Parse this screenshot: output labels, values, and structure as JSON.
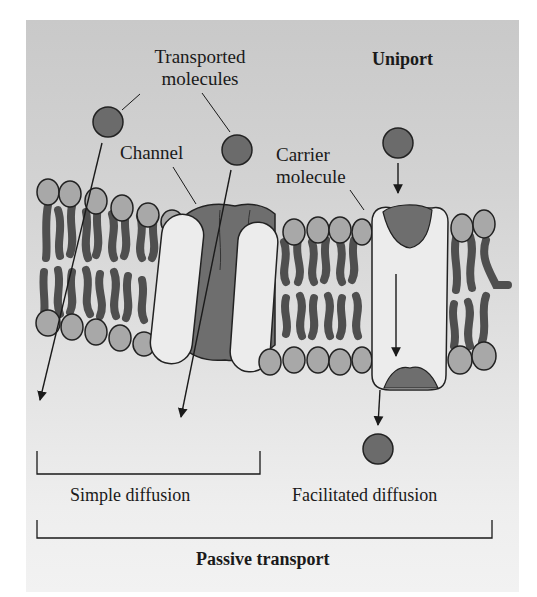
{
  "title": "Uniport",
  "labels": {
    "transported_molecules_line1": "Transported",
    "transported_molecules_line2": "molecules",
    "channel": "Channel",
    "carrier_line1": "Carrier",
    "carrier_line2": "molecule",
    "simple_diffusion": "Simple diffusion",
    "facilitated_diffusion": "Facilitated diffusion",
    "passive_transport": "Passive transport"
  },
  "colors": {
    "panel_top": "#c9c9c9",
    "panel_bottom": "#f2f2f2",
    "molecule": "#6b6b6b",
    "lipid_head": "#a8a8a8",
    "lipid_tail": "#4f4f4f",
    "protein_light": "#ececec",
    "protein_dark": "#6e6e6e",
    "line": "#1a1a1a"
  },
  "components": [
    {
      "name": "lipid-bilayer",
      "description": "Phospholipid bilayer membrane"
    },
    {
      "name": "channel-protein",
      "description": "Channel spanning the membrane"
    },
    {
      "name": "carrier-protein",
      "description": "Carrier molecule with binding sites"
    },
    {
      "name": "transported-molecules",
      "description": "Solute molecules crossing membrane"
    }
  ],
  "groups": [
    {
      "label": "Simple diffusion",
      "members": [
        "direct through bilayer",
        "through channel"
      ]
    },
    {
      "label": "Facilitated diffusion",
      "members": [
        "carrier molecule"
      ]
    },
    {
      "label": "Passive transport",
      "members": [
        "Simple diffusion",
        "Facilitated diffusion"
      ]
    }
  ]
}
